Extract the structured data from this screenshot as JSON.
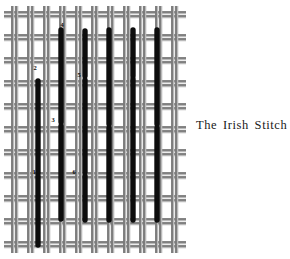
{
  "figure": {
    "caption": "The Irish Stitch",
    "title": "The Irish Stitch",
    "background_color": "#ffffff",
    "thread_color": "#6e6e6e",
    "thread_shadow_color": "#b9b9b9",
    "stitch_color": "#0d0d0d",
    "label_color": "#0d0d0d"
  },
  "canvas": {
    "description": "woven needlework canvas ground of paired warp and weft threads",
    "columns": 11,
    "rows": 11,
    "x_start": 12,
    "x_step": 16,
    "y_start": 12,
    "y_step": 23,
    "thread_pair_gap": 4,
    "thread_width": 1.6
  },
  "stitch_numbers": [
    {
      "label": "1",
      "x": 34,
      "y": 174
    },
    {
      "label": "2",
      "x": 35,
      "y": 70
    },
    {
      "label": "3",
      "x": 53,
      "y": 122
    },
    {
      "label": "4",
      "x": 62,
      "y": 27
    },
    {
      "label": "5",
      "x": 79,
      "y": 77
    },
    {
      "label": "6",
      "x": 74,
      "y": 174
    }
  ],
  "stitches": [
    {
      "id": "s1",
      "x": 38,
      "y1": 81,
      "y2": 173
    },
    {
      "id": "s2",
      "x": 38,
      "y1": 176,
      "y2": 245
    },
    {
      "id": "s3",
      "x": 61,
      "y1": 30,
      "y2": 122
    },
    {
      "id": "s4",
      "x": 61,
      "y1": 126,
      "y2": 219
    },
    {
      "id": "s5",
      "x": 85,
      "y1": 31,
      "y2": 76
    },
    {
      "id": "s6",
      "x": 85,
      "y1": 80,
      "y2": 172
    },
    {
      "id": "s7",
      "x": 85,
      "y1": 176,
      "y2": 220
    },
    {
      "id": "s8",
      "x": 109,
      "y1": 30,
      "y2": 124
    },
    {
      "id": "s9",
      "x": 109,
      "y1": 128,
      "y2": 220
    },
    {
      "id": "s10",
      "x": 133,
      "y1": 30,
      "y2": 76
    },
    {
      "id": "s11",
      "x": 133,
      "y1": 79,
      "y2": 172
    },
    {
      "id": "s12",
      "x": 133,
      "y1": 175,
      "y2": 220
    },
    {
      "id": "s13",
      "x": 157,
      "y1": 30,
      "y2": 124
    },
    {
      "id": "s14",
      "x": 157,
      "y1": 128,
      "y2": 220
    }
  ]
}
